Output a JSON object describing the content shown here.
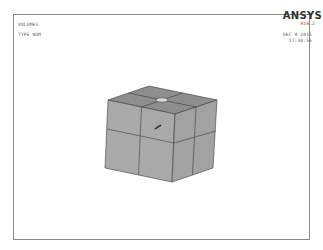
{
  "plot": {
    "title_line1": "VOLUMES",
    "title_line2": "TYPE NUM",
    "brand": "ANSYS",
    "release": "R16.2",
    "date": "DEC  9 2015",
    "time": "17:30:56"
  },
  "model": {
    "description": "Isometric view of a cube volume subdivided into 2x2x2 blocks with a small hole on top face",
    "colors": {
      "top_face": "#8e8e8e",
      "left_face": "#a9a9a9",
      "right_face": "#a2a2a2",
      "edge": "#3a3a3a",
      "hole": "#d8d8d8"
    },
    "triad_icon": "coordinate-triad-icon"
  }
}
